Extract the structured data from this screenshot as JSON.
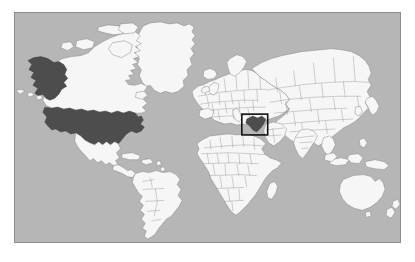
{
  "figure": {
    "frame": {
      "x": 14,
      "y": 12,
      "width": 387,
      "height": 231,
      "border_color": "#8d8d8d"
    },
    "page_background": "#ffffff"
  },
  "map": {
    "projection": "equirectangular",
    "ocean_color": "#b6b6b6",
    "land_color": "#f6f6f6",
    "land_border_color": "#7e7e7e",
    "highlight_color": "#4d4d4d",
    "inset_box_color": "#111111",
    "highlighted_regions": [
      {
        "name": "United States (contiguous)",
        "fill": "#4d4d4d"
      },
      {
        "name": "Alaska",
        "fill": "#4d4d4d"
      },
      {
        "name": "Middle East country in inset",
        "fill": "#3f3f3f"
      }
    ],
    "inset_box": {
      "label": "Middle East detail box",
      "x": 243,
      "y": 115,
      "width": 26,
      "height": 20
    },
    "continents": [
      "North America",
      "South America",
      "Greenland",
      "Europe",
      "Africa",
      "Asia",
      "Australia",
      "New Zealand"
    ]
  }
}
